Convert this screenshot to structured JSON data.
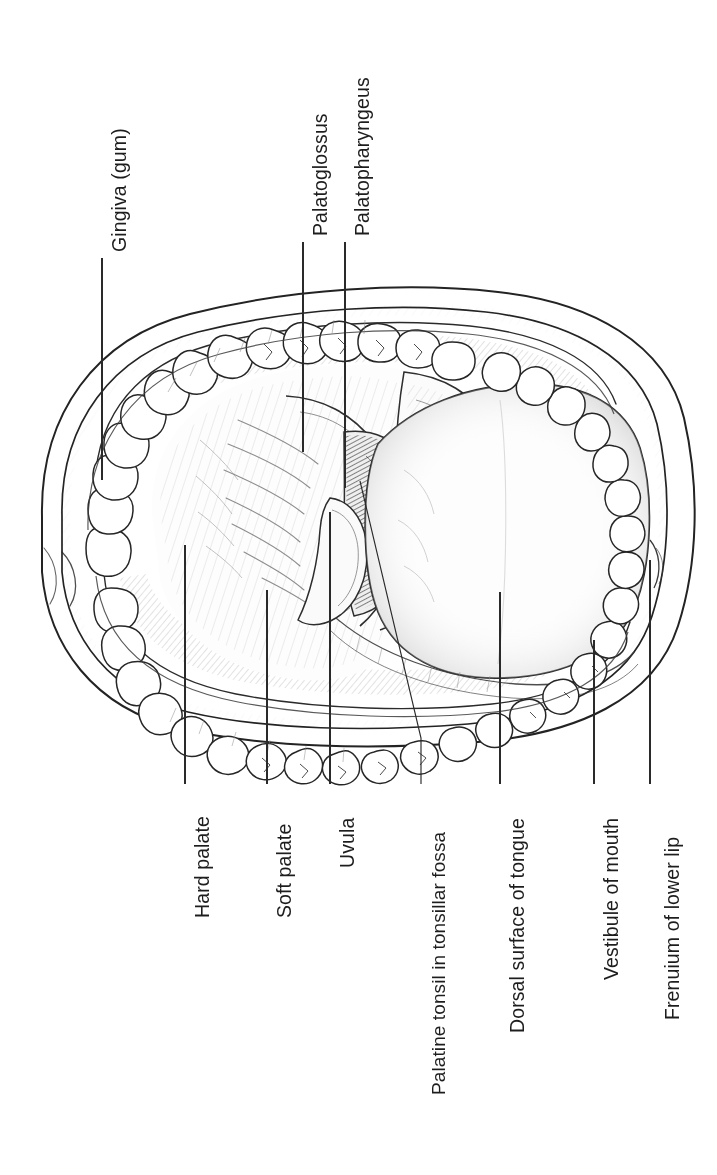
{
  "figure": {
    "orientation": "labels rotated 90 degrees counter-clockwise",
    "style": "black and white pen-and-ink medical illustration with graphite shading",
    "canvas": {
      "width": 717,
      "height": 1175
    },
    "background_color": "#ffffff",
    "ink_color": "#1d1d1d",
    "shade_color": "#7d7d7d",
    "tonsil_shade_color": "#5a5a5a"
  },
  "labels": {
    "top": [
      {
        "id": "gingiva",
        "text": "Gingiva (gum)",
        "x": 102,
        "text_bottom": 252,
        "line_from": 258,
        "line_to": 480
      },
      {
        "id": "palatoglossus",
        "text": "Palatoglossus",
        "x": 303,
        "text_bottom": 236,
        "line_from": 242,
        "line_to": 452
      },
      {
        "id": "palatopharyngeus",
        "text": "Palatopharyngeus",
        "x": 345,
        "text_bottom": 236,
        "line_from": 242,
        "line_to": 488
      }
    ],
    "bottom": [
      {
        "id": "hard-palate",
        "text": "Hard palate",
        "x": 185,
        "text_top": 790,
        "line_from": 545,
        "line_to": 784
      },
      {
        "id": "soft-palate",
        "text": "Soft palate",
        "x": 267,
        "text_top": 790,
        "line_from": 590,
        "line_to": 784
      },
      {
        "id": "uvula",
        "text": "Uvula",
        "x": 330,
        "text_top": 790,
        "line_from": 512,
        "line_to": 784
      },
      {
        "id": "palatine-tonsil",
        "text": "Palatine tonsil in tonsillar fossa",
        "x": 421,
        "text_top": 790,
        "line_from": 738,
        "line_to": 784,
        "elbow": {
          "x1": 360,
          "y1": 481,
          "x2": 421,
          "y2": 738
        }
      },
      {
        "id": "dorsal-tongue",
        "text": "Dorsal surface of tongue",
        "x": 500,
        "text_top": 790,
        "line_from": 592,
        "line_to": 784
      },
      {
        "id": "vestibule",
        "text": "Vestibule of mouth",
        "x": 594,
        "text_top": 790,
        "line_from": 640,
        "line_to": 784
      },
      {
        "id": "frenulum",
        "text": "Frenuium of lower lip",
        "x": 650,
        "text_top": 790,
        "line_from": 560,
        "line_to": 784
      }
    ]
  },
  "structures": [
    "outer lip border",
    "inner lip / vermilion border",
    "upper gingiva (gum)",
    "lower gingiva (gum)",
    "upper dental arch - 16 teeth",
    "lower dental arch - 16 teeth",
    "hard palate with rugae",
    "soft palate",
    "uvula",
    "palatoglossal arch",
    "palatopharyngeal arch",
    "palatine tonsil in tonsillar fossa",
    "dorsal surface of tongue",
    "vestibule of mouth",
    "frenulum of lower lip"
  ]
}
